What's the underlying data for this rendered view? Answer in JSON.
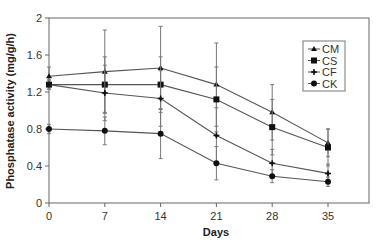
{
  "chart_data": {
    "type": "line",
    "title": "",
    "xlabel": "Days",
    "ylabel": "Phosphatase activity (mg/g/h)",
    "x": [
      0,
      7,
      14,
      21,
      28,
      35
    ],
    "x_ticks": [
      "0",
      "7",
      "14",
      "21",
      "28",
      "35"
    ],
    "y_ticks": [
      "0",
      "0.4",
      "0.8",
      "1.2",
      "1.6",
      "2"
    ],
    "ylim": [
      0,
      2
    ],
    "xlim": [
      0,
      42
    ],
    "grid": false,
    "legend_position": "upper right (inside)",
    "series": [
      {
        "name": "CM",
        "marker": "triangle",
        "values": [
          1.37,
          1.42,
          1.46,
          1.28,
          0.98,
          0.65
        ],
        "errors": [
          0.1,
          0.45,
          0.45,
          0.45,
          0.3,
          0.15
        ]
      },
      {
        "name": "CS",
        "marker": "square",
        "values": [
          1.28,
          1.28,
          1.28,
          1.12,
          0.82,
          0.6
        ],
        "errors": [
          0.05,
          0.3,
          0.3,
          0.35,
          0.3,
          0.2
        ]
      },
      {
        "name": "CF",
        "marker": "plus",
        "values": [
          1.28,
          1.19,
          1.13,
          0.73,
          0.43,
          0.32
        ],
        "errors": [
          0.05,
          0.3,
          0.3,
          0.3,
          0.15,
          0.1
        ]
      },
      {
        "name": "CK",
        "marker": "circle",
        "values": [
          0.8,
          0.78,
          0.75,
          0.43,
          0.29,
          0.23
        ],
        "errors": [
          0.05,
          0.15,
          0.27,
          0.18,
          0.07,
          0.05
        ]
      }
    ]
  }
}
